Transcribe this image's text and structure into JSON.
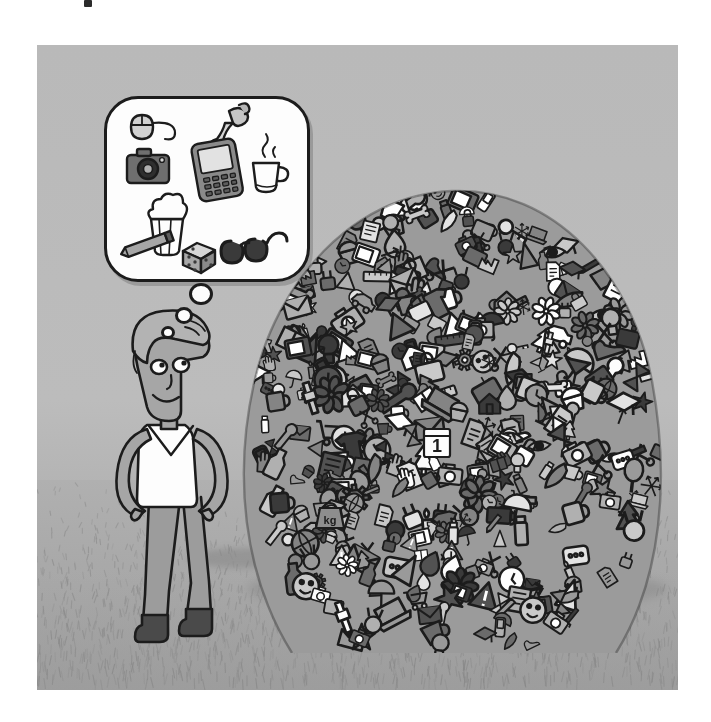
{
  "artwork": {
    "title": "Man contemplating a huge pile of stuff",
    "style": "hand-drawn greyscale cartoon illustration",
    "palette": {
      "sky": "#b9b9b9",
      "ground": "#a9a9a9",
      "ink": "#1c1c1c",
      "paper_white": "#fdfdfd",
      "mid_grey": "#8e8e8e",
      "light_grey": "#c9c9c9",
      "dark_grey": "#4a4a4a",
      "skin": "#a6a6a6",
      "shirt": "#fdfdfd",
      "trousers": "#9c9c9c",
      "boots": "#4a4a4a"
    },
    "canvas": {
      "width": 711,
      "height": 722,
      "panel_x": 37,
      "panel_y": 45,
      "panel_w": 641,
      "panel_h": 645
    }
  },
  "character": {
    "name": "standing-man",
    "pose": "hands on hips, head turned right, smiling",
    "features": [
      "swept-back hair",
      "two eyes looking right",
      "nose",
      "smile",
      "v-neck t-shirt",
      "long trousers",
      "ankle boots"
    ],
    "garments": {
      "top": "white v-neck t-shirt",
      "bottom": "grey trousers",
      "shoes": "dark grey boots"
    }
  },
  "thought_bubble": {
    "name": "thought-bubble",
    "shape": "rounded square",
    "tail_dots": 3,
    "items": [
      {
        "id": "computer-mouse",
        "label": "computer mouse with cable"
      },
      {
        "id": "hand-holding-tool",
        "label": "hand holding an object"
      },
      {
        "id": "camera",
        "label": "photo camera"
      },
      {
        "id": "smartphone",
        "label": "smartphone / PDA with keypad"
      },
      {
        "id": "coffee-cup",
        "label": "steaming coffee cup"
      },
      {
        "id": "popcorn",
        "label": "popcorn box"
      },
      {
        "id": "pencil",
        "label": "pencil"
      },
      {
        "id": "dice",
        "label": "six-sided die"
      },
      {
        "id": "sunglasses",
        "label": "sunglasses"
      }
    ]
  },
  "pile": {
    "name": "pile-of-objects",
    "description": "Large mound of hundreds of overlapping doodled consumer objects",
    "approx_item_count": 420,
    "labelled_items": [
      {
        "id": "calendar",
        "label": "calendar showing 1"
      },
      {
        "id": "weight",
        "label": "kg weight"
      }
    ],
    "recognisable_items": [
      "car",
      "dice",
      "t-shirt",
      "envelope",
      "tennis-racquet",
      "flower",
      "hourglass",
      "balloon",
      "camera",
      "television",
      "padlock",
      "document",
      "ruler",
      "clock",
      "graduation-cap",
      "eye",
      "cupcake",
      "martini-glass",
      "candle",
      "house",
      "factory",
      "shopping-cart",
      "scissors",
      "key",
      "umbrella",
      "globe",
      "mobile-phone",
      "briefcase",
      "pencil",
      "wrench",
      "gear",
      "megaphone",
      "scale",
      "apple",
      "feather",
      "teapot",
      "mug",
      "bicycle-wheel",
      "light-bulb",
      "smiley-face",
      "warning-sign",
      "tree",
      "hand",
      "bottle",
      "jar",
      "book",
      "laptop",
      "keyboard",
      "telephone",
      "spray-can",
      "lollipop",
      "cherry",
      "star",
      "medal",
      "paint-roller",
      "syringe",
      "battery",
      "plug",
      "shoe",
      "hat",
      "comb",
      "fish",
      "bone",
      "toothbrush",
      "suitcase",
      "ticket",
      "cash",
      "gift-box",
      "magnifier",
      "snowflake",
      "leaf",
      "bread",
      "paint-brush",
      "trophy"
    ]
  },
  "calendar_label": "1",
  "weight_label": "kg",
  "scene": {
    "horizon_note": "grass-hatched ground meets flat grey sky",
    "shadows": [
      "shadow under the man's feet",
      "shadow under the pile"
    ]
  }
}
